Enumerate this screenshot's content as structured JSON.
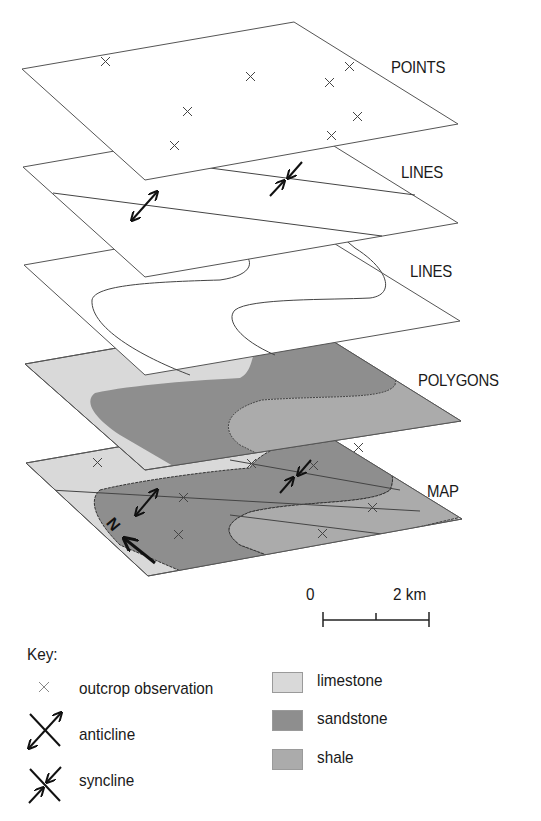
{
  "layers": [
    {
      "name": "points",
      "label": "POINTS"
    },
    {
      "name": "lines-folds",
      "label": "LINES"
    },
    {
      "name": "lines-contacts",
      "label": "LINES"
    },
    {
      "name": "polygons",
      "label": "POLYGONS"
    },
    {
      "name": "map",
      "label": "MAP"
    }
  ],
  "scale_bar": {
    "start_label": "0",
    "end_label": "2 km"
  },
  "north_arrow": {
    "label": "N"
  },
  "key": {
    "title": "Key:",
    "symbols": [
      {
        "icon": "cross-icon",
        "label": "outcrop observation"
      },
      {
        "icon": "anticline-icon",
        "label": "anticline"
      },
      {
        "icon": "syncline-icon",
        "label": "syncline"
      }
    ],
    "units": [
      {
        "label": "limestone",
        "color": "#d9d9d9"
      },
      {
        "label": "sandstone",
        "color": "#8e8e8e"
      },
      {
        "label": "shale",
        "color": "#ababab"
      }
    ]
  },
  "colors": {
    "limestone": "#d9d9d9",
    "sandstone": "#8e8e8e",
    "shale": "#ababab",
    "line": "#3a3a3a"
  }
}
